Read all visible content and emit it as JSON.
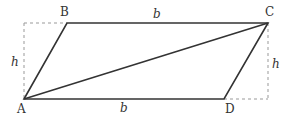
{
  "diagram": {
    "vertices": {
      "A": {
        "label": "A",
        "x": 24,
        "y": 99
      },
      "B": {
        "label": "B",
        "x": 67,
        "y": 23
      },
      "C": {
        "label": "C",
        "x": 268,
        "y": 23
      },
      "D": {
        "label": "D",
        "x": 224,
        "y": 99
      }
    },
    "side_labels": {
      "top": "b",
      "bottom": "b"
    },
    "height_labels": {
      "left": "h",
      "right": "h"
    },
    "colors": {
      "line": "#333333",
      "dashed": "#999999"
    }
  }
}
